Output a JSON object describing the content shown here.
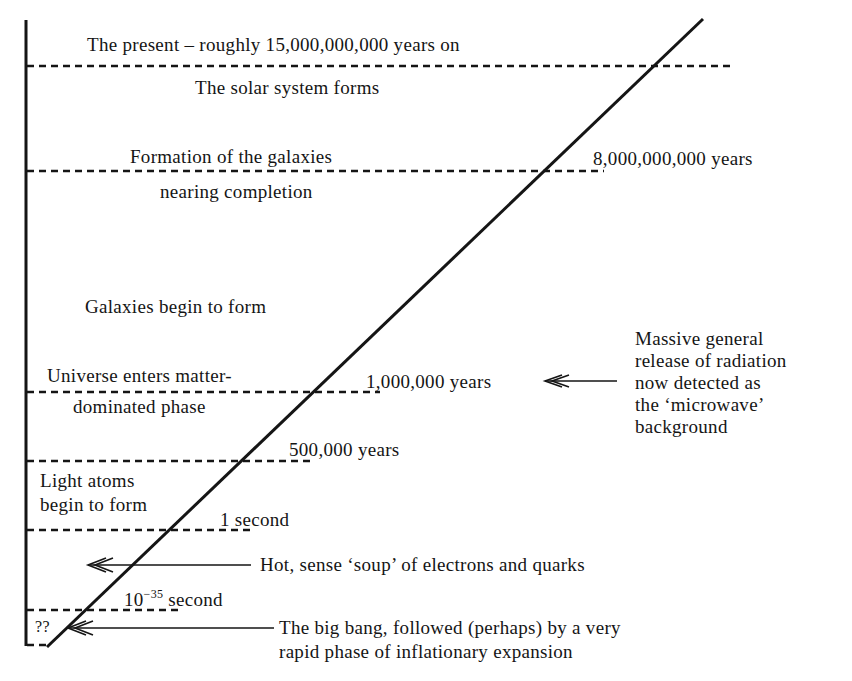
{
  "diagram": {
    "type": "cosmic-timeline",
    "colors": {
      "ink": "#151515",
      "background": "#ffffff"
    },
    "events": [
      {
        "id": "present",
        "label": "The present – roughly 15,000,000,000 years on"
      },
      {
        "id": "solar_system",
        "label": "The solar system forms"
      },
      {
        "id": "galaxies_complete_1",
        "label": "Formation of the galaxies"
      },
      {
        "id": "galaxies_complete_2",
        "label": "nearing completion"
      },
      {
        "id": "galaxies_begin",
        "label": "Galaxies begin to form"
      },
      {
        "id": "matter_1",
        "label": "Universe enters matter-"
      },
      {
        "id": "matter_2",
        "label": "dominated phase"
      },
      {
        "id": "atoms_1",
        "label": "Light atoms"
      },
      {
        "id": "atoms_2",
        "label": "begin to form"
      },
      {
        "id": "unknown",
        "label": "??"
      }
    ],
    "times": {
      "t8b": "8,000,000,000 years",
      "t1m": "1,000,000 years",
      "t500k": "500,000 years",
      "t1s": "1 second",
      "t_planck_base": "10",
      "t_planck_exp": "−35",
      "t_planck_unit": " second"
    },
    "annotations": {
      "microwave": [
        "Massive general",
        "release of radiation",
        "now detected as",
        "the ‘microwave’",
        "background"
      ],
      "soup": "Hot, sense ‘soup’ of electrons and quarks",
      "bigbang_1": "The big bang, followed (perhaps) by a very",
      "bigbang_2": "rapid phase of inflationary expansion"
    }
  }
}
